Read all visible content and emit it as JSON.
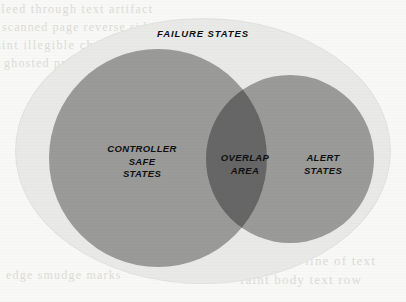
{
  "diagram": {
    "type": "venn",
    "universe": {
      "label": "FAILURE STATES",
      "shape": "ellipse",
      "fill_color": "#e9e9e7"
    },
    "sets": [
      {
        "id": "controller-safe-states",
        "label": "CONTROLLER\nSAFE\nSTATES",
        "shape": "circle",
        "fill_color": "#a9a9a9"
      },
      {
        "id": "alert-states",
        "label": "ALERT\nSTATES",
        "shape": "circle",
        "fill_color": "#a9a9a9"
      }
    ],
    "intersection": {
      "id": "overlap-area",
      "label": "OVERLAP\nAREA",
      "fill_color": "#8e8e8e"
    }
  },
  "background": {
    "page_color": "#f8f8f6",
    "bleed_text": {
      "line1": "bleed through text artifact",
      "line2": "scanned page reverse side",
      "line3": "faint illegible characters",
      "line4": "ghosted printing residue",
      "line5": "illegible heading",
      "line6": "ghosted line of text",
      "line7": "faint body text row",
      "line8": "edge smudge marks"
    }
  }
}
